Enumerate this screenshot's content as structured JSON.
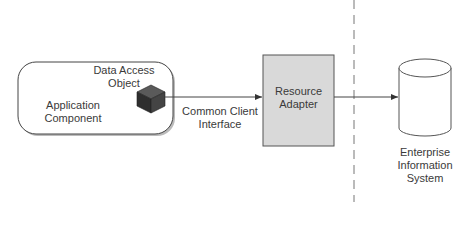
{
  "diagram": {
    "application_component": {
      "label_line1": "Application",
      "label_line2": "Component"
    },
    "data_access_object": {
      "label_line1": "Data Access",
      "label_line2": "Object",
      "icon": "cube-icon"
    },
    "connector_label": {
      "line1": "Common Client",
      "line2": "Interface"
    },
    "resource_adapter": {
      "label_line1": "Resource",
      "label_line2": "Adapter",
      "fill": "#d9d9d9"
    },
    "eis": {
      "label_line1": "Enterprise",
      "label_line2": "Information",
      "label_line3": "System",
      "icon": "database-cylinder-icon"
    },
    "colors": {
      "stroke": "#444444",
      "cube_top": "#555555",
      "cube_left": "#2e2e2e",
      "cube_right": "#444444",
      "dashed_line": "#777777"
    }
  }
}
